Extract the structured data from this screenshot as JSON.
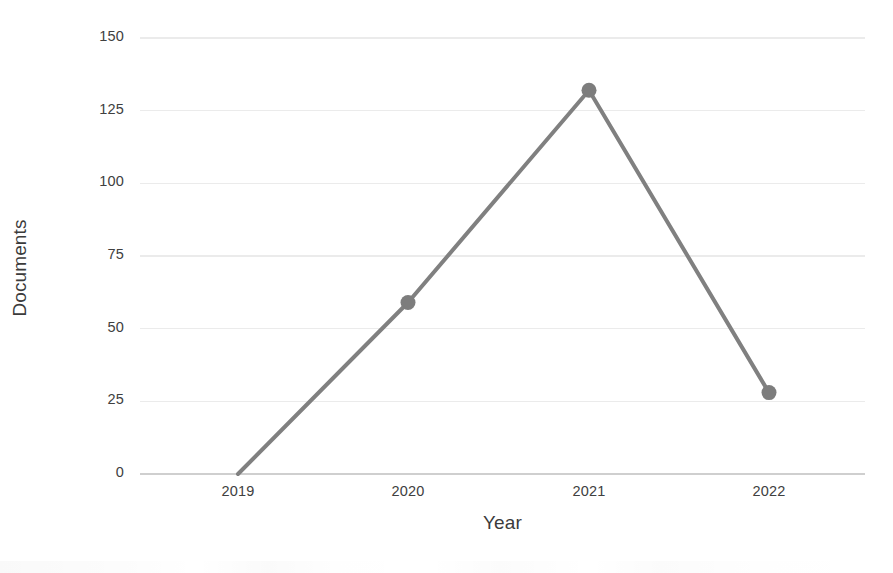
{
  "chart_data": {
    "type": "line",
    "title": "",
    "subtitle": "",
    "xlabel": "Year",
    "ylabel": "Documents",
    "categories": [
      "2019",
      "2020",
      "2021",
      "2022"
    ],
    "values": [
      0,
      59,
      132,
      28
    ],
    "series": [
      {
        "name": "Documents",
        "values": [
          0,
          59,
          132,
          28
        ]
      }
    ],
    "ylim": [
      0,
      150
    ],
    "yticks": [
      0,
      25,
      50,
      75,
      100,
      125,
      150
    ],
    "ytick_labels": [
      "0",
      "25",
      "50",
      "75",
      "100",
      "125",
      "150"
    ],
    "xtick_labels": [
      "2019",
      "2020",
      "2021",
      "2022"
    ],
    "grid": true,
    "grid_axis": "y",
    "legend": false,
    "legend_position": "none",
    "markers": [
      {
        "category": "2019",
        "value": 0,
        "visible": false
      },
      {
        "category": "2020",
        "value": 59,
        "visible": true
      },
      {
        "category": "2021",
        "value": 132,
        "visible": true
      },
      {
        "category": "2022",
        "value": 28,
        "visible": true
      }
    ],
    "colors": {
      "line": "#808080",
      "marker": "#7d7d7d",
      "grid": "#ebebeb",
      "axis": "#cfcfcf",
      "tick_text": "#404040",
      "axis_title": "#3b3b3b",
      "background": "#ffffff"
    },
    "line_width": 4
  }
}
